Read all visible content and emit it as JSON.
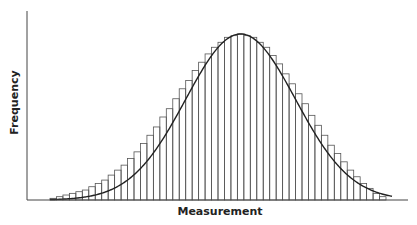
{
  "chart_data": {
    "type": "bar",
    "title": "",
    "subtitle": "",
    "xlabel": "Measurement",
    "ylabel": "Frequency",
    "grid": false,
    "legend": null,
    "x_ticks": [],
    "y_ticks": [],
    "bins": 52,
    "peak_bin": 27,
    "ylim": [
      0,
      1.0
    ],
    "values": [
      0.01,
      0.02,
      0.03,
      0.04,
      0.05,
      0.06,
      0.08,
      0.1,
      0.12,
      0.15,
      0.18,
      0.21,
      0.25,
      0.29,
      0.34,
      0.39,
      0.44,
      0.5,
      0.55,
      0.61,
      0.67,
      0.72,
      0.78,
      0.83,
      0.88,
      0.92,
      0.95,
      0.98,
      0.99,
      1.0,
      0.99,
      0.98,
      0.95,
      0.92,
      0.87,
      0.82,
      0.76,
      0.7,
      0.64,
      0.58,
      0.51,
      0.45,
      0.39,
      0.33,
      0.28,
      0.23,
      0.18,
      0.14,
      0.1,
      0.07,
      0.04,
      0.02
    ],
    "curve": {
      "type": "normal",
      "mean_bin": 29.5,
      "sd_bins": 8.5
    }
  },
  "labels": {
    "x": "Measurement",
    "y": "Frequency"
  }
}
